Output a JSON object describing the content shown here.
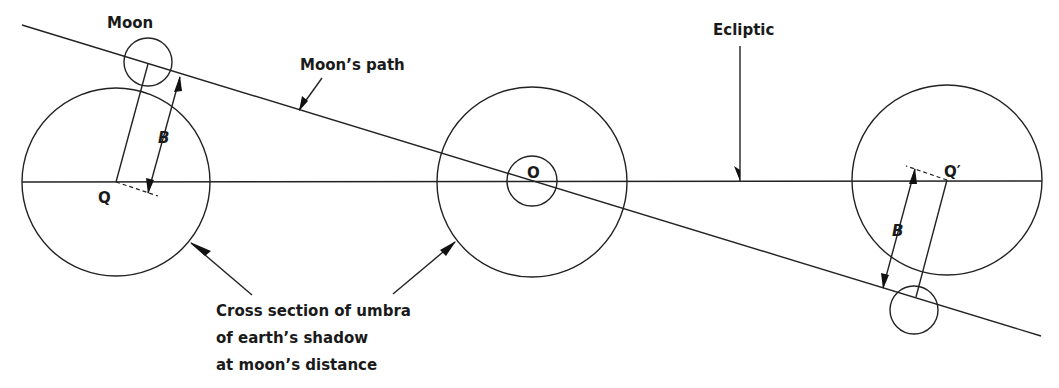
{
  "diagram": {
    "labels": {
      "moon": "Moon",
      "moons_path": "Moon’s path",
      "ecliptic": "Ecliptic",
      "q": "Q",
      "q_prime": "Q′",
      "o": "O",
      "b_left": "B",
      "b_right": "B",
      "caption_line1": "Cross section of umbra",
      "caption_line2": "of earth’s shadow",
      "caption_line3": "at moon’s distance"
    },
    "elements": {
      "ecliptic_line": {
        "x1": 22,
        "y1": 182,
        "x2": 1042,
        "y2": 182
      },
      "moons_path_line": {
        "x1": 22,
        "y1": 25,
        "x2": 1041,
        "y2": 336
      },
      "umbra_left": {
        "cx": 116,
        "cy": 182,
        "r": 94
      },
      "umbra_center": {
        "cx": 532,
        "cy": 182,
        "r": 95
      },
      "umbra_right": {
        "cx": 947,
        "cy": 180,
        "r": 95
      },
      "moon_left": {
        "cx": 148,
        "cy": 62,
        "r": 24
      },
      "moon_center": {
        "cx": 532,
        "cy": 181,
        "r": 25
      },
      "moon_right": {
        "cx": 914,
        "cy": 310,
        "r": 24
      }
    },
    "colors": {
      "stroke": "#222222",
      "background": "#ffffff",
      "text": "#1a1a1a"
    }
  }
}
